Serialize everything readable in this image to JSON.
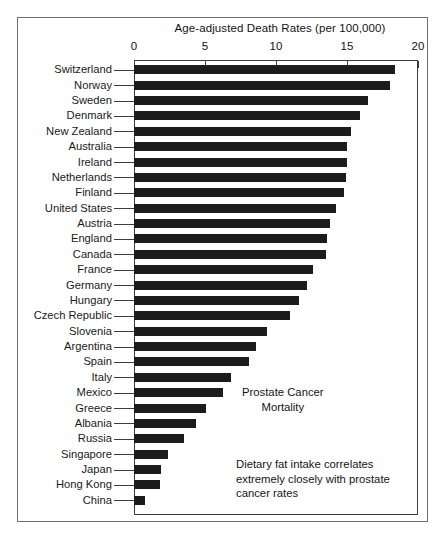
{
  "chart_data": {
    "type": "bar",
    "orientation": "horizontal",
    "title": "Age-adjusted Death Rates (per 100,000)",
    "xlabel": "Age-adjusted Death Rates (per 100,000)",
    "ylabel": "",
    "xlim": [
      0,
      20
    ],
    "xticks": [
      0,
      5,
      10,
      15,
      20
    ],
    "xtick_labels": [
      "0",
      "5",
      "10",
      "15",
      "20"
    ],
    "grid": false,
    "legend": null,
    "bar_color": "#1c1c1c",
    "categories": [
      "Switzerland",
      "Norway",
      "Sweden",
      "Denmark",
      "New Zealand",
      "Australia",
      "Ireland",
      "Netherlands",
      "Finland",
      "United States",
      "Austria",
      "England",
      "Canada",
      "France",
      "Germany",
      "Hungary",
      "Czech Republic",
      "Slovenia",
      "Argentina",
      "Spain",
      "Italy",
      "Mexico",
      "Greece",
      "Albania",
      "Russia",
      "Singapore",
      "Japan",
      "Hong Kong",
      "China"
    ],
    "values": [
      18.4,
      18.0,
      16.5,
      15.9,
      15.3,
      15.0,
      15.0,
      14.9,
      14.8,
      14.2,
      13.8,
      13.6,
      13.5,
      12.6,
      12.2,
      11.6,
      11.0,
      9.4,
      8.6,
      8.1,
      6.8,
      6.3,
      5.1,
      4.4,
      3.5,
      2.4,
      1.9,
      1.8,
      0.8
    ],
    "annotations": [
      {
        "text": "Prostate Cancer\nMortality",
        "x": 11.5,
        "y": "Spain"
      },
      {
        "text": "Dietary fat intake correlates\nextremely closely with prostate\ncancer rates",
        "x": 10.5,
        "y": "Russia"
      }
    ]
  },
  "annotation_title": "Prostate Cancer\nMortality",
  "annotation_note": "Dietary fat intake correlates\nextremely closely with prostate\ncancer rates"
}
